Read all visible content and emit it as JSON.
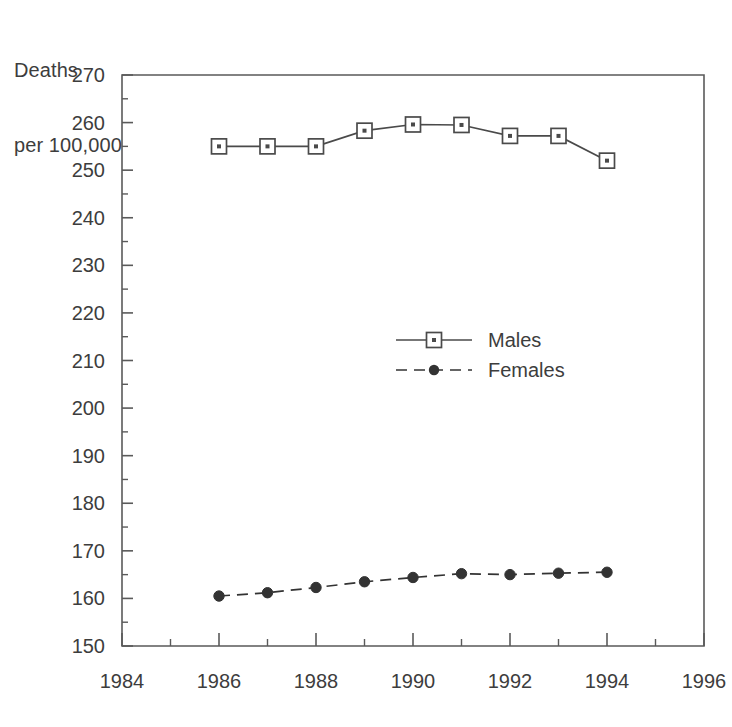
{
  "chart_data": {
    "type": "line",
    "title": "",
    "ylabel_line1": "Deaths",
    "ylabel_line2": "per 100,000",
    "xlabel": "",
    "x": [
      1986,
      1987,
      1988,
      1989,
      1990,
      1991,
      1992,
      1993,
      1994
    ],
    "xlim": [
      1984,
      1996
    ],
    "ylim": [
      150,
      270
    ],
    "ytick_step": 10,
    "yminor_step": 5,
    "xtick_step": 2,
    "xminor_step": 1,
    "grid": false,
    "legend_position": "center",
    "xticklabels": [
      "1984",
      "1986",
      "1988",
      "1990",
      "1992",
      "1994",
      "1996"
    ],
    "yticklabels": [
      "150",
      "160",
      "170",
      "180",
      "190",
      "200",
      "210",
      "220",
      "230",
      "240",
      "250",
      "260",
      "270"
    ],
    "series": [
      {
        "name": "Males",
        "marker": "open-square",
        "linestyle": "solid",
        "color": "#4a4a4a",
        "values": [
          255.0,
          255.0,
          255.0,
          258.3,
          259.6,
          259.5,
          257.2,
          257.2,
          252.0
        ]
      },
      {
        "name": "Females",
        "marker": "filled-circle",
        "linestyle": "dashed",
        "color": "#333333",
        "values": [
          160.5,
          161.2,
          162.3,
          163.5,
          164.4,
          165.2,
          165.0,
          165.3,
          165.5
        ]
      }
    ]
  },
  "legend": {
    "items": [
      {
        "label": "Males"
      },
      {
        "label": "Females"
      }
    ]
  },
  "colors": {
    "axis": "#5a5a5a",
    "text": "#3d3d3d",
    "males": "#4a4a4a",
    "females": "#333333",
    "background": "#ffffff"
  }
}
